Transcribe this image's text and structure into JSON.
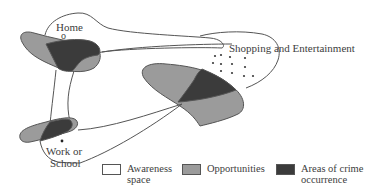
{
  "diagram": {
    "labels": {
      "home": "Home",
      "home_marker": "o",
      "shopping": "Shopping and Entertainment",
      "work_line1": "Work or",
      "work_line2": "School"
    },
    "legend": [
      {
        "label_line1": "Awareness",
        "label_line2": "space",
        "color": "#ffffff"
      },
      {
        "label_line1": "Opportunities",
        "label_line2": "",
        "color": "#9b9b9b"
      },
      {
        "label_line1": "Areas of crime",
        "label_line2": "occurrence",
        "color": "#3b3b3b"
      }
    ],
    "colors": {
      "outline": "#555555",
      "opportunity": "#9b9b9b",
      "crime": "#3b3b3b",
      "background": "#ffffff"
    }
  }
}
